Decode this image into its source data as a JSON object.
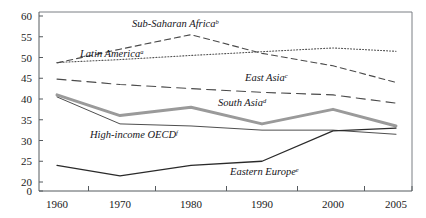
{
  "chart_data": {
    "type": "line",
    "title": "",
    "xlabel": "",
    "ylabel": "",
    "x": [
      1960,
      1970,
      1980,
      1990,
      2000,
      2005
    ],
    "xticklabels": [
      "1960",
      "1970",
      "1980",
      "1990",
      "2000",
      "2005"
    ],
    "yticklabels": [
      "60",
      "55",
      "50",
      "45",
      "40",
      "35",
      "30",
      "25",
      "20",
      "0"
    ],
    "yticks": [
      60,
      55,
      50,
      45,
      40,
      35,
      30,
      25,
      20,
      0
    ],
    "ylim": [
      20,
      60
    ],
    "axis_break": true,
    "grid": false,
    "legend": "inline-annotations",
    "series": [
      {
        "name": "Sub-Saharan Africa",
        "label": "Sub-Saharan Africa",
        "superscript": "b",
        "style": "dashed",
        "color": "#4a4a4a",
        "width": 1.1,
        "values": [
          48.7,
          52.0,
          55.5,
          51.0,
          48.0,
          44.0
        ]
      },
      {
        "name": "Latin America",
        "label": "Latin America",
        "superscript": "a",
        "style": "dotted",
        "color": "#555555",
        "width": 1.1,
        "values": [
          48.8,
          49.5,
          50.5,
          51.4,
          52.3,
          51.5
        ]
      },
      {
        "name": "East Asia",
        "label": "East Asia",
        "superscript": "c",
        "style": "long-dashed",
        "color": "#4a4a4a",
        "width": 1.1,
        "values": [
          44.8,
          43.5,
          42.5,
          41.6,
          41.0,
          39.0
        ]
      },
      {
        "name": "South Asia",
        "label": "South Asia",
        "superscript": "d",
        "style": "solid-thick-gray",
        "color": "#9a9a9a",
        "width": 3.0,
        "values": [
          41.0,
          36.0,
          38.0,
          34.0,
          37.5,
          33.5
        ]
      },
      {
        "name": "High-income OECD",
        "label": "High-income OECD",
        "superscript": "f",
        "style": "solid-thin",
        "color": "#3a3a3a",
        "width": 0.9,
        "values": [
          40.5,
          34.0,
          33.5,
          32.5,
          32.5,
          31.5
        ]
      },
      {
        "name": "Eastern Europe",
        "label": "Eastern Europe",
        "superscript": "e",
        "style": "solid-medium",
        "color": "#2a2a2a",
        "width": 1.3,
        "values": [
          24.0,
          21.5,
          24.0,
          25.0,
          32.3,
          33.0
        ]
      }
    ],
    "annotations": [
      {
        "name": "sub-saharan-africa-annotation",
        "text": "Sub-Saharan Africa",
        "sup": "b",
        "x": 132,
        "y": 27
      },
      {
        "name": "latin-america-annotation",
        "text": "Latin America",
        "sup": "a",
        "x": 80,
        "y": 57
      },
      {
        "name": "east-asia-annotation",
        "text": "East Asia",
        "sup": "c",
        "x": 245,
        "y": 81
      },
      {
        "name": "south-asia-annotation",
        "text": "South Asia",
        "sup": "d",
        "x": 218,
        "y": 106
      },
      {
        "name": "high-income-oecd-annotation",
        "text": "High-income OECD",
        "sup": "f",
        "x": 90,
        "y": 138
      },
      {
        "name": "eastern-europe-annotation",
        "text": "Eastern Europe",
        "sup": "e",
        "x": 230,
        "y": 175
      }
    ]
  },
  "layout": {
    "plot_left": 39,
    "plot_right": 412,
    "plot_top": 12,
    "plot_bottom": 191
  }
}
